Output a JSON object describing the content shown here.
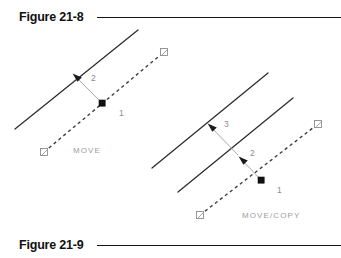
{
  "page": {
    "background_color": "#ffffff",
    "width": 341,
    "height": 258
  },
  "captions": {
    "top": {
      "label": "Figure 21-8",
      "rule_color": "#141414"
    },
    "bottom": {
      "label": "Figure 21-9",
      "rule_color": "#141414"
    }
  },
  "diagrams": [
    {
      "id": "move-diagram",
      "command_label": "MOVE",
      "description": "Single object line moved from base point along displacement vector",
      "step_labels": [
        {
          "id": "step-1",
          "text": "1",
          "meaning": "base point"
        },
        {
          "id": "step-2",
          "text": "2",
          "meaning": "second point of displacement"
        }
      ],
      "colors": {
        "object_line": "#2b2b2b",
        "displacement_line": "#3a3a3a",
        "leader": "#9a9a9a",
        "label_text": "#8c8c8c",
        "base_point": "#101010",
        "node_marker_stroke": "#8e8e8e"
      }
    },
    {
      "id": "move-copy-diagram",
      "command_label": "MOVE/COPY",
      "description": "Object line moved and copied, producing two parallel lines",
      "step_labels": [
        {
          "id": "step-1",
          "text": "1",
          "meaning": "base point"
        },
        {
          "id": "step-2",
          "text": "2",
          "meaning": "second point of displacement"
        },
        {
          "id": "step-3",
          "text": "3",
          "meaning": "third point of displacement"
        }
      ],
      "colors": {
        "object_line": "#2b2b2b",
        "displacement_line": "#3a3a3a",
        "leader": "#9a9a9a",
        "label_text": "#8c8c8c",
        "base_point": "#101010",
        "node_marker_stroke": "#8e8e8e"
      }
    }
  ]
}
